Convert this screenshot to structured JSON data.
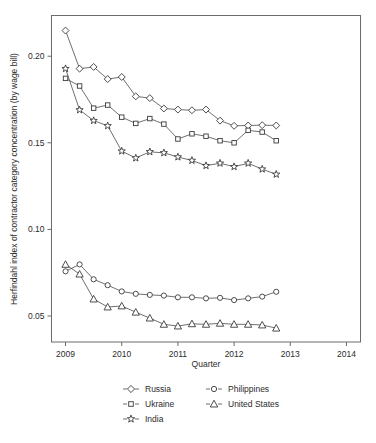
{
  "chart_data": {
    "type": "line",
    "title": "",
    "xlabel": "Quarter",
    "ylabel": "Herfindahl index of contractor category concentration (by wage bill)",
    "xlim": [
      2008.75,
      2014.25
    ],
    "ylim": [
      0.035,
      0.2235
    ],
    "xticks": [
      2009,
      2010,
      2011,
      2012,
      2013,
      2014
    ],
    "xticklabels": [
      "2009",
      "2010",
      "2011",
      "2012",
      "2013",
      "2014"
    ],
    "yticks": [
      0.05,
      0.1,
      0.15,
      0.2
    ],
    "yticklabels": [
      "0.05",
      "0.10",
      "0.15",
      "0.20"
    ],
    "grid": false,
    "legend_position": "bottom",
    "x": [
      2009.0,
      2009.25,
      2009.5,
      2009.75,
      2010.0,
      2010.25,
      2010.5,
      2010.75,
      2011.0,
      2011.25,
      2011.5,
      2011.75,
      2012.0,
      2012.25,
      2012.5,
      2012.75
    ],
    "series": [
      {
        "name": "Russia",
        "marker": "diamond",
        "values": [
          0.2148,
          0.1928,
          0.1938,
          0.1868,
          0.188,
          0.1768,
          0.1758,
          0.1698,
          0.1692,
          0.1688,
          0.1692,
          0.1628,
          0.1598,
          0.16,
          0.1602,
          0.16
        ]
      },
      {
        "name": "Ukraine",
        "marker": "square",
        "values": [
          0.1872,
          0.1828,
          0.17,
          0.1718,
          0.1648,
          0.1612,
          0.164,
          0.1608,
          0.1522,
          0.1552,
          0.1538,
          0.1512,
          0.15,
          0.1572,
          0.1562,
          0.1512
        ]
      },
      {
        "name": "India",
        "marker": "star",
        "values": [
          0.1928,
          0.169,
          0.1628,
          0.1598,
          0.1452,
          0.1412,
          0.1448,
          0.1442,
          0.1418,
          0.1398,
          0.1368,
          0.1382,
          0.1362,
          0.1382,
          0.1348,
          0.1318
        ]
      },
      {
        "name": "Philippines",
        "marker": "circle",
        "values": [
          0.0758,
          0.0798,
          0.0712,
          0.0678,
          0.0642,
          0.0628,
          0.0622,
          0.0618,
          0.0608,
          0.0608,
          0.0602,
          0.0605,
          0.0592,
          0.0602,
          0.0612,
          0.064
        ]
      },
      {
        "name": "United States",
        "marker": "triangle",
        "values": [
          0.0798,
          0.0742,
          0.0598,
          0.0552,
          0.0558,
          0.0522,
          0.0488,
          0.0452,
          0.0442,
          0.0455,
          0.0452,
          0.0458,
          0.0452,
          0.0452,
          0.0448,
          0.043
        ]
      }
    ],
    "legend": [
      {
        "label": "Russia",
        "marker": "diamond"
      },
      {
        "label": "Philippines",
        "marker": "circle"
      },
      {
        "label": "Ukraine",
        "marker": "square"
      },
      {
        "label": "United States",
        "marker": "triangle"
      },
      {
        "label": "India",
        "marker": "star"
      }
    ],
    "colors": {
      "axis": "#6b6b6b",
      "line": "#4a4a4a",
      "marker_stroke": "#3a3a3a",
      "marker_fill": "#ffffff",
      "text": "#2b2b2b",
      "background": "#ffffff"
    }
  }
}
